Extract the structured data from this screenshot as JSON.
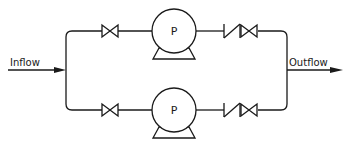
{
  "diagram": {
    "type": "piping-schematic",
    "inlet": {
      "label": "Inflow"
    },
    "outlet": {
      "label": "Outflow"
    },
    "trains": [
      {
        "id": "top",
        "components": [
          "gate-valve",
          "pump",
          "check-valve",
          "gate-valve"
        ],
        "pump_label": "P"
      },
      {
        "id": "bottom",
        "components": [
          "gate-valve",
          "pump",
          "check-valve",
          "gate-valve"
        ],
        "pump_label": "P"
      }
    ]
  },
  "colors": {
    "stroke": "#1a1a1a",
    "background": "#ffffff"
  }
}
